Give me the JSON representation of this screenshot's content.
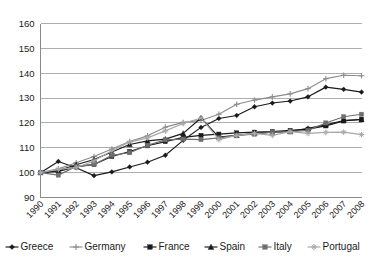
{
  "chart_data": {
    "type": "line",
    "title": "",
    "subtitle": "",
    "xlabel": "",
    "ylabel": "",
    "xlim": [
      1990,
      2008
    ],
    "ylim": [
      90,
      160
    ],
    "yticks": [
      90,
      100,
      110,
      120,
      130,
      140,
      150,
      160
    ],
    "grid": true,
    "legend_position": "bottom",
    "categories": [
      "1990",
      "1991",
      "1992",
      "1993",
      "1994",
      "1995",
      "1996",
      "1997",
      "1998",
      "1999",
      "2000",
      "2001",
      "2002",
      "2003",
      "2004",
      "2005",
      "2006",
      "2007",
      "2008"
    ],
    "series": [
      {
        "name": "Greece",
        "color": "#1a1a1a",
        "marker": "diamond",
        "values": [
          100.0,
          104.5,
          102.0,
          98.8,
          100.3,
          102.3,
          104.2,
          107.0,
          113.0,
          118.2,
          121.8,
          123.0,
          126.5,
          128.0,
          128.8,
          130.5,
          134.4,
          133.5,
          132.4
        ]
      },
      {
        "name": "Germany",
        "color": "#8c8c8c",
        "marker": "plus",
        "values": [
          100.0,
          101.5,
          104.0,
          106.5,
          109.5,
          112.5,
          114.8,
          118.3,
          120.2,
          121.0,
          123.5,
          127.5,
          129.2,
          130.5,
          131.7,
          133.8,
          137.8,
          139.2,
          139.0
        ]
      },
      {
        "name": "France",
        "color": "#1a1a1a",
        "marker": "square",
        "values": [
          100.0,
          100.5,
          102.3,
          103.3,
          106.5,
          108.5,
          110.8,
          112.5,
          114.2,
          115.0,
          115.5,
          116.0,
          116.3,
          116.5,
          117.0,
          117.5,
          118.8,
          120.8,
          121.5
        ]
      },
      {
        "name": "Spain",
        "color": "#1a1a1a",
        "marker": "triangle",
        "values": [
          100.0,
          100.8,
          103.2,
          105.3,
          108.3,
          111.3,
          112.8,
          113.5,
          115.8,
          122.0,
          114.3,
          115.0,
          115.8,
          116.3,
          116.5,
          117.8,
          119.2,
          121.0,
          121.3
        ]
      },
      {
        "name": "Italy",
        "color": "#6e6e6e",
        "marker": "square-gray",
        "values": [
          100.0,
          99.0,
          102.5,
          103.3,
          107.0,
          108.0,
          111.0,
          113.2,
          113.5,
          113.3,
          114.0,
          115.0,
          115.5,
          116.3,
          116.5,
          117.0,
          120.0,
          122.5,
          123.5
        ]
      },
      {
        "name": "Portugal",
        "color": "#a8a8a8",
        "marker": "star",
        "values": [
          100.0,
          101.3,
          102.0,
          104.8,
          108.8,
          112.3,
          114.0,
          116.8,
          119.8,
          122.0,
          113.3,
          115.0,
          115.8,
          115.0,
          116.5,
          115.8,
          116.2,
          116.3,
          115.3
        ]
      }
    ]
  }
}
